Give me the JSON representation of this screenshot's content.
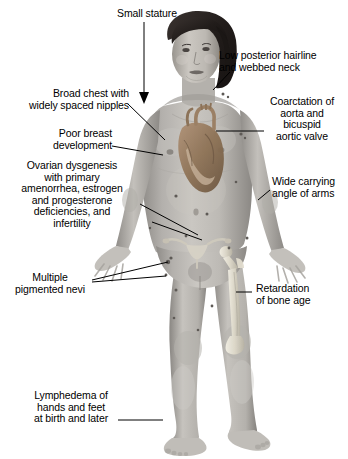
{
  "illustration": {
    "title": "Turner syndrome clinical features diagram",
    "subject": "anatomical female figure, grayscale photographic",
    "background_color": "#ffffff",
    "leader_line_color": "#000000",
    "text_color": "#000000",
    "skin_tone": "#b9b6b2",
    "hair_color": "#241f1d",
    "heart_overlay_color": "#9a7e62",
    "bone_overlay_color": "#e6e2d6"
  },
  "labels": [
    {
      "id": "small-stature",
      "text": "Small stature",
      "align": "center",
      "pointer": "arrow-down",
      "x": 112,
      "y": 8
    },
    {
      "id": "low-posterior-hairline",
      "text": "Low posterior hairline\nand webbed neck",
      "align": "left",
      "pointer": "line",
      "x": 233,
      "y": 50
    },
    {
      "id": "broad-chest",
      "text": "Broad chest with\nwidely spaced nipples",
      "align": "right",
      "pointer": "line",
      "x": 18,
      "y": 88
    },
    {
      "id": "coarctation-aorta",
      "text": "Coarctation of\naorta and\nbicuspid\naortic valve",
      "align": "center",
      "pointer": "line",
      "x": 267,
      "y": 96
    },
    {
      "id": "poor-breast-development",
      "text": "Poor breast\ndevelopment",
      "align": "right",
      "pointer": "line",
      "x": 40,
      "y": 128
    },
    {
      "id": "ovarian-dysgenesis",
      "text": "Ovarian dysgenesis\nwith primary\namenorrhea, estrogen\nand progesterone\ndeficiencies, and\ninfertility",
      "align": "center",
      "pointer": "line",
      "x": 14,
      "y": 160
    },
    {
      "id": "wide-carrying-angle",
      "text": "Wide carrying\nangle of arms",
      "align": "left",
      "pointer": "line",
      "x": 272,
      "y": 176
    },
    {
      "id": "multiple-pigmented-nevi",
      "text": "Multiple\npigmented nevi",
      "align": "center",
      "pointer": "line-double",
      "x": 24,
      "y": 278
    },
    {
      "id": "retardation-bone-age",
      "text": "Retardation\nof bone age",
      "align": "left",
      "pointer": "line",
      "x": 256,
      "y": 283
    },
    {
      "id": "lymphedema",
      "text": "Lymphedema of\nhands and feet\nat birth and later",
      "align": "center",
      "pointer": "line",
      "x": 38,
      "y": 390
    }
  ]
}
